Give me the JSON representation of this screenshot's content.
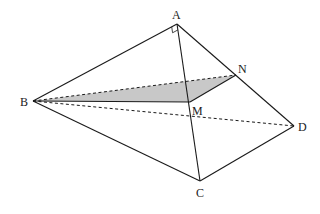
{
  "figure": {
    "type": "tetrahedron with section",
    "points": {
      "A": {
        "label": "A",
        "x": 177,
        "y": 24,
        "lx": 172,
        "ly": 19
      },
      "B": {
        "label": "B",
        "x": 33,
        "y": 101,
        "lx": 20,
        "ly": 106
      },
      "C": {
        "label": "C",
        "x": 200,
        "y": 181,
        "lx": 196,
        "ly": 197
      },
      "D": {
        "label": "D",
        "x": 294,
        "y": 126,
        "lx": 298,
        "ly": 131
      },
      "M": {
        "label": "M",
        "x": 190,
        "y": 102,
        "lx": 192,
        "ly": 115
      },
      "N": {
        "label": "N",
        "x": 236,
        "y": 75,
        "lx": 238,
        "ly": 73
      }
    },
    "solid_edges": [
      [
        "A",
        "B"
      ],
      [
        "A",
        "C"
      ],
      [
        "A",
        "D"
      ],
      [
        "B",
        "C"
      ],
      [
        "C",
        "D"
      ],
      [
        "B",
        "M"
      ],
      [
        "M",
        "N"
      ]
    ],
    "dashed_edges": [
      [
        "B",
        "D"
      ],
      [
        "B",
        "N"
      ]
    ],
    "shaded_region": [
      "B",
      "N",
      "M"
    ],
    "shade_color": "#c8c8c8",
    "line_color": "#1a1a1a",
    "right_angle_at": "A"
  }
}
